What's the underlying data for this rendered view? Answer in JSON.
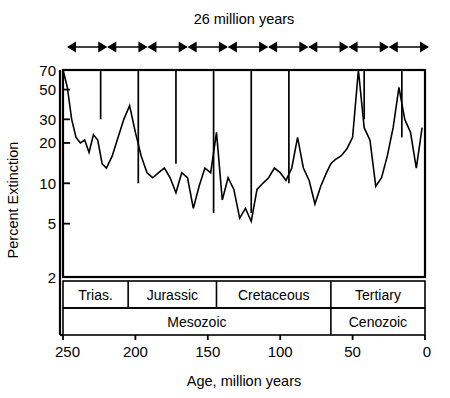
{
  "figure": {
    "top_label": "26 million years",
    "x_axis_title": "Age, million years",
    "y_axis_title": "Percent Extinction"
  },
  "chart_data": {
    "type": "line",
    "title": "26 million years",
    "xlabel": "Age, million years",
    "ylabel": "Percent Extinction",
    "xlim": [
      250,
      0
    ],
    "x_reversed": true,
    "xticks": [
      250,
      200,
      150,
      100,
      50,
      0
    ],
    "xticklabels": [
      "250",
      "200",
      "150",
      "100",
      "50",
      "0"
    ],
    "ylim": [
      2,
      70
    ],
    "yscale": "log",
    "yticks": [
      70,
      50,
      30,
      20,
      10,
      5,
      2
    ],
    "yticklabels": [
      "70",
      "50",
      "30",
      "20",
      "10",
      "5",
      "2"
    ],
    "grid": false,
    "legend": null,
    "series": [
      {
        "name": "Percent extinction of marine genera",
        "x": [
          250,
          247,
          244,
          241,
          238,
          235,
          232,
          229,
          226,
          223,
          220,
          216,
          212,
          208,
          204,
          200,
          196,
          192,
          188,
          184,
          180,
          176,
          172,
          168,
          164,
          160,
          156,
          152,
          148,
          144,
          140,
          136,
          132,
          128,
          124,
          120,
          116,
          112,
          108,
          104,
          100,
          96,
          92,
          88,
          84,
          80,
          76,
          72,
          68,
          65,
          62,
          58,
          54,
          50,
          46,
          42,
          38,
          34,
          30,
          26,
          22,
          18,
          14,
          10,
          6,
          2
        ],
        "y": [
          70,
          52,
          30,
          22,
          20,
          21,
          17,
          23,
          21,
          14,
          13,
          16,
          22,
          30,
          38,
          24,
          16,
          12,
          11,
          12,
          13,
          11,
          8.5,
          12,
          11,
          6.5,
          9.5,
          13,
          12,
          24,
          7.5,
          11,
          9,
          5.5,
          6.5,
          5.2,
          9,
          10,
          11,
          13,
          12,
          10.5,
          13,
          22,
          13,
          10.5,
          7,
          9.5,
          12,
          14,
          15,
          16,
          18,
          22,
          70,
          26,
          21,
          9.5,
          11,
          16,
          26,
          52,
          30,
          24,
          13,
          26
        ]
      }
    ],
    "cycle_interval_myr": 26,
    "cycle_markers_ma": [
      250,
      224,
      198,
      172,
      146,
      120,
      94,
      68,
      42,
      16
    ],
    "cycle_dropline_depths_pct": [
      20,
      30,
      10,
      14,
      6,
      6,
      10,
      70,
      30,
      22
    ],
    "arrow_segments": 9,
    "bands_periods": [
      {
        "label": "Trias.",
        "start_ma": 250,
        "end_ma": 205
      },
      {
        "label": "Jurassic",
        "start_ma": 205,
        "end_ma": 144
      },
      {
        "label": "Cretaceous",
        "start_ma": 144,
        "end_ma": 65
      },
      {
        "label": "Tertiary",
        "start_ma": 65,
        "end_ma": 0
      }
    ],
    "bands_eras": [
      {
        "label": "Mesozoic",
        "start_ma": 250,
        "end_ma": 65
      },
      {
        "label": "Cenozoic",
        "start_ma": 65,
        "end_ma": 0
      }
    ]
  },
  "colors": {
    "line": "#000000",
    "axis": "#000000",
    "background": "#ffffff"
  }
}
